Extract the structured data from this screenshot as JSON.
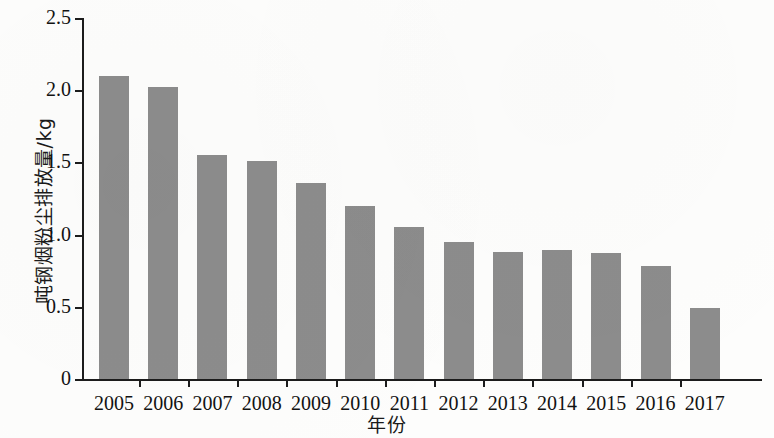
{
  "chart_data": {
    "type": "bar",
    "title": "",
    "xlabel": "年份",
    "ylabel": "吨钢烟粉尘排放量/kg",
    "categories": [
      "2005",
      "2006",
      "2007",
      "2008",
      "2009",
      "2010",
      "2011",
      "2012",
      "2013",
      "2014",
      "2015",
      "2016",
      "2017"
    ],
    "values": [
      2.1,
      2.02,
      1.55,
      1.51,
      1.36,
      1.2,
      1.05,
      0.95,
      0.88,
      0.89,
      0.87,
      0.78,
      0.49
    ],
    "series": [
      {
        "name": "吨钢烟粉尘排放量",
        "values": [
          2.1,
          2.02,
          1.55,
          1.51,
          1.36,
          1.2,
          1.05,
          0.95,
          0.88,
          0.89,
          0.87,
          0.78,
          0.49
        ]
      }
    ],
    "ylim": [
      0,
      2.5
    ],
    "y_ticks": [
      0,
      0.5,
      1.0,
      1.5,
      2.0,
      2.5
    ],
    "y_tick_labels": [
      "0",
      "0.5",
      "1.0",
      "1.5",
      "2.0",
      "2.5"
    ],
    "grid": false,
    "legend": false,
    "legend_position": "none",
    "bar_color": "#8c8c8c",
    "axis_color": "#1c1c1c",
    "text_color": "#121212",
    "background_color": "#fdfdfc"
  },
  "axes": {
    "y_title": "吨钢烟粉尘排放量/kg",
    "x_title": "年份"
  }
}
